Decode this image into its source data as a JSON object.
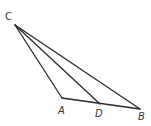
{
  "diagram": {
    "type": "triangle",
    "points": {
      "C": {
        "x": 15,
        "y": 25,
        "label": "C",
        "label_x": 5,
        "label_y": 20
      },
      "A": {
        "x": 62,
        "y": 98,
        "label": "A",
        "label_x": 58,
        "label_y": 114
      },
      "D": {
        "x": 100,
        "y": 104,
        "label": "D",
        "label_x": 95,
        "label_y": 117
      },
      "B": {
        "x": 140,
        "y": 109,
        "label": "B",
        "label_x": 138,
        "label_y": 120
      }
    },
    "segments": [
      {
        "from": "C",
        "to": "A"
      },
      {
        "from": "C",
        "to": "D"
      },
      {
        "from": "C",
        "to": "B"
      },
      {
        "from": "A",
        "to": "B"
      }
    ],
    "colors": {
      "stroke": "#2a2a2a",
      "label": "#333333"
    }
  }
}
